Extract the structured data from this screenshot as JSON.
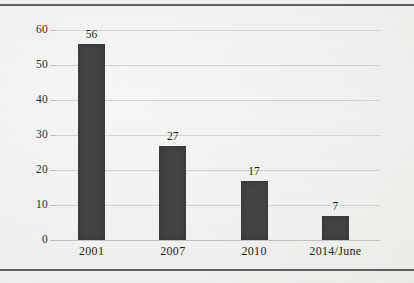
{
  "figure": {
    "background_color": "#f3f3f1",
    "rule_color": "#5e5e5e",
    "bar_color": "#434343",
    "gridline_color": "#d2d2cf",
    "text_color": "#1f1f1f"
  },
  "chart_data": {
    "type": "bar",
    "title": "",
    "subtitle": "",
    "xlabel": "",
    "ylabel": "",
    "categories": [
      "2001",
      "2007",
      "2010",
      "2014/June"
    ],
    "values": [
      56,
      27,
      17,
      7
    ],
    "data_labels": [
      "56",
      "27",
      "17",
      "7"
    ],
    "ylim": [
      0,
      60
    ],
    "ytick_values": [
      0,
      10,
      20,
      30,
      40,
      50,
      60
    ],
    "ytick_labels": [
      "0",
      "10",
      "20",
      "30",
      "40",
      "50",
      "60"
    ],
    "grid": true,
    "grid_axis": "y",
    "legend": false,
    "legend_position": "none",
    "series": [
      {
        "name": "",
        "values": [
          56,
          27,
          17,
          7
        ]
      }
    ]
  }
}
